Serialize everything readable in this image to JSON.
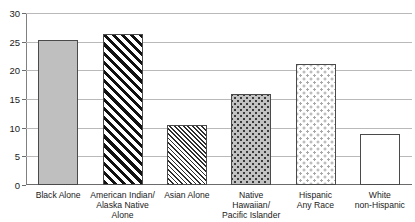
{
  "chart_data": {
    "type": "bar",
    "title": "",
    "xlabel": "",
    "ylabel": "",
    "ylim": [
      0,
      30
    ],
    "yticks": [
      0,
      5,
      10,
      15,
      20,
      25,
      30
    ],
    "ytick_labels": [
      "0",
      "5",
      "10",
      "15",
      "20",
      "25",
      "30"
    ],
    "grid": "horizontal",
    "legend": "none",
    "categories": [
      "Black Alone",
      "American Indian/ Alaska Native Alone",
      "Asian Alone",
      "Native Hawaiian/ Pacific Islander",
      "Hispanic Any Race",
      "White non-Hispanic"
    ],
    "values": [
      25.3,
      26.4,
      10.5,
      15.9,
      21.1,
      8.9
    ],
    "series": [
      {
        "name": "Percent",
        "values": [
          25.3,
          26.4,
          10.5,
          15.9,
          21.1,
          8.9
        ]
      }
    ]
  },
  "axes": {
    "y_ticks": [
      {
        "label": "30",
        "value": 30
      },
      {
        "label": "25",
        "value": 25
      },
      {
        "label": "20",
        "value": 20
      },
      {
        "label": "15",
        "value": 15
      },
      {
        "label": "10",
        "value": 10
      },
      {
        "label": "5",
        "value": 5
      },
      {
        "label": "0",
        "value": 0
      }
    ]
  },
  "bars": [
    {
      "name": "black-alone",
      "value": 25.3,
      "fill": "solid-gray",
      "color": "#bfbfbf",
      "label_lines": [
        "Black Alone"
      ]
    },
    {
      "name": "american-indian-alaska-native-alone",
      "value": 26.4,
      "fill": "diagonal-bold",
      "color": "#111111",
      "label_lines": [
        "American Indian/",
        "Alaska Native",
        "Alone"
      ]
    },
    {
      "name": "asian-alone",
      "value": 10.5,
      "fill": "diagonal-fine",
      "color": "#2d2d2d",
      "label_lines": [
        "Asian Alone"
      ]
    },
    {
      "name": "native-hawaiian-pacific-islander",
      "value": 15.9,
      "fill": "dotted-gray",
      "color": "#c2c2c2",
      "label_lines": [
        "Native",
        "Hawaiian/",
        "Pacific Islander"
      ]
    },
    {
      "name": "hispanic-any-race",
      "value": 21.1,
      "fill": "dotted-light",
      "color": "#ffffff",
      "label_lines": [
        "Hispanic",
        "Any Race"
      ]
    },
    {
      "name": "white-non-hispanic",
      "value": 8.9,
      "fill": "white",
      "color": "#ffffff",
      "label_lines": [
        "White",
        "non-Hispanic"
      ]
    }
  ],
  "title_sliver": ""
}
